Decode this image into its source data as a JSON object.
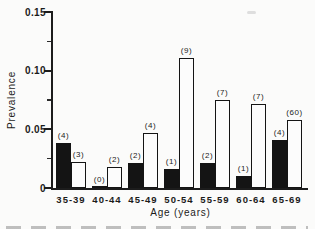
{
  "figure": {
    "background_color": "#fbfbfa",
    "axis_color": "#1c1c1c",
    "filled_bar_color": "#141414",
    "open_bar_fill": "#fcfcfc",
    "open_bar_outline": "#141414"
  },
  "chart_data": {
    "type": "bar",
    "title": "",
    "xlabel": "Age (years)",
    "ylabel": "Prevalence",
    "ylim": [
      0,
      0.15
    ],
    "grid": false,
    "legend": "none",
    "yticks": [
      {
        "value": 0,
        "label": "0"
      },
      {
        "value": 0.05,
        "label": "0.05"
      },
      {
        "value": 0.1,
        "label": "0.10"
      },
      {
        "value": 0.15,
        "label": "0.15"
      }
    ],
    "minor_yticks": [
      0.025,
      0.075,
      0.125
    ],
    "categories": [
      "35-39",
      "40-44",
      "45-49",
      "50-54",
      "55-59",
      "60-64",
      "65-69"
    ],
    "series": [
      {
        "name": "filled-bars",
        "style": "filled",
        "values": [
          0.038,
          0.001,
          0.021,
          0.016,
          0.021,
          0.01,
          0.041
        ],
        "count_labels": [
          "(4)",
          "(0)",
          "(2)",
          "(1)",
          "(2)",
          "(1)",
          "(4)"
        ]
      },
      {
        "name": "open-bars",
        "style": "open",
        "values": [
          0.022,
          0.018,
          0.047,
          0.111,
          0.075,
          0.072,
          0.058
        ],
        "count_labels": [
          "(3)",
          "(2)",
          "(4)",
          "(9)",
          "(7)",
          "(7)",
          "(60)"
        ]
      }
    ]
  }
}
